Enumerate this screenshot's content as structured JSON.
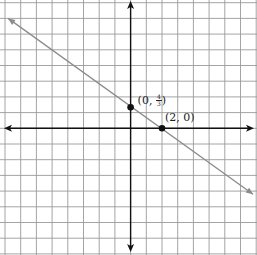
{
  "figure": {
    "grid": {
      "x_min": -8,
      "x_max": 8,
      "y_min": -8,
      "y_max": 8,
      "unit_px": 15.7,
      "origin_px": [
        130.6,
        128.3
      ]
    },
    "colors": {
      "grid": "#9a9a9a",
      "axis": "#111111",
      "line": "#8c8c8c",
      "point": "#111111"
    },
    "line": {
      "equation": "y = -2/3 x + 4/3",
      "from": [
        -7.8,
        7.0
      ],
      "to": [
        7.8,
        -4.2
      ]
    },
    "points": [
      {
        "name": "y-intercept",
        "x": 0,
        "y": 1.3333,
        "label_prefix": "(0, ",
        "label_num": "4",
        "label_den": "3",
        "label_suffix": ")"
      },
      {
        "name": "x-intercept",
        "x": 2,
        "y": 0,
        "label": "(2, 0)"
      }
    ]
  }
}
